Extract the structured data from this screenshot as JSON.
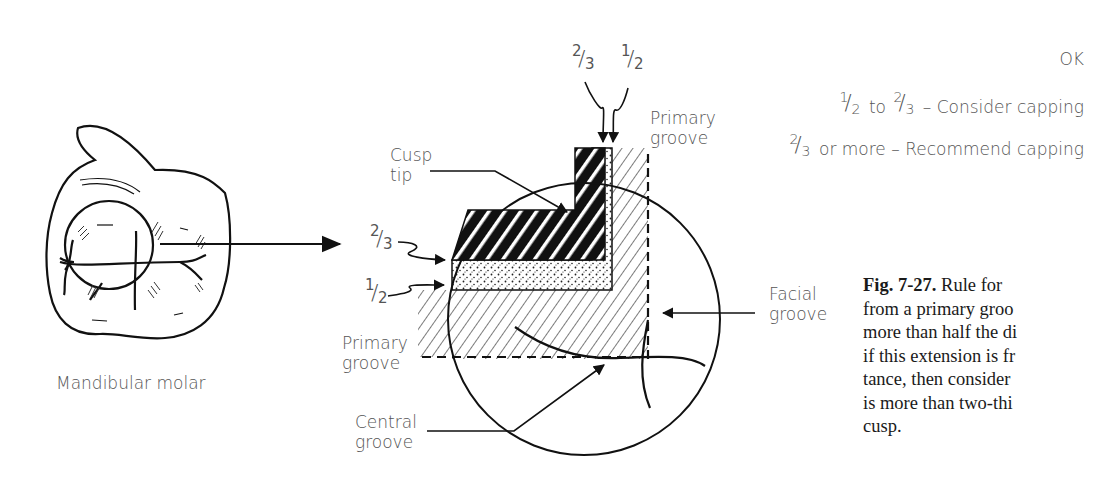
{
  "figure": {
    "left_panel": {
      "label": "Mandibular molar"
    },
    "detail_panel": {
      "top_fractions": [
        {
          "numerator": "2",
          "denominator": "3"
        },
        {
          "numerator": "1",
          "denominator": "2"
        }
      ],
      "left_fractions": [
        {
          "numerator": "2",
          "denominator": "3"
        },
        {
          "numerator": "1",
          "denominator": "2"
        }
      ],
      "labels": {
        "cusp_tip_line1": "Cusp",
        "cusp_tip_line2": "tip",
        "primary_groove_top_line1": "Primary",
        "primary_groove_top_line2": "groove",
        "primary_groove_left_line1": "Primary",
        "primary_groove_left_line2": "groove",
        "facial_groove_line1": "Facial",
        "facial_groove_line2": "groove",
        "central_groove_line1": "Central",
        "central_groove_line2": "groove"
      }
    },
    "legend": {
      "row1": {
        "text": "OK"
      },
      "row2": {
        "frac1_n": "1",
        "frac1_d": "2",
        "mid": "to",
        "frac2_n": "2",
        "frac2_d": "3",
        "text": "– Consider capping"
      },
      "row3": {
        "frac_n": "2",
        "frac_d": "3",
        "text": "or more – Recommend capping"
      }
    },
    "caption": {
      "label": "Fig. 7-27.",
      "lines": [
        "Rule for",
        "from a primary groo",
        "more than half the di",
        "if this extension is fr",
        "tance, then consider",
        "is more than two-thi",
        "cusp."
      ]
    }
  }
}
